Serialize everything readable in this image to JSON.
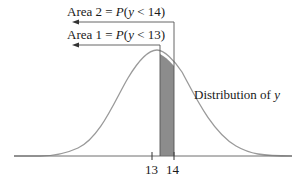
{
  "diagram": {
    "title": "",
    "area2": {
      "prefix": "Area 2 = ",
      "func": "P",
      "expr_open": "(",
      "var": "y",
      "rel": " < 14)"
    },
    "area1": {
      "prefix": "Area 1 = ",
      "func": "P",
      "expr_open": "(",
      "var": "y",
      "rel": " < 13)"
    },
    "curve_label": {
      "text": "Distribution of ",
      "var": "y"
    },
    "ticks": [
      "13",
      "14"
    ],
    "shaded_region": {
      "from": 13,
      "to": 14,
      "color": "#8c8c8c"
    },
    "curve_color": "#9a9a9a",
    "axis_color": "#6e6e6e",
    "arrow_color": "#555555"
  }
}
